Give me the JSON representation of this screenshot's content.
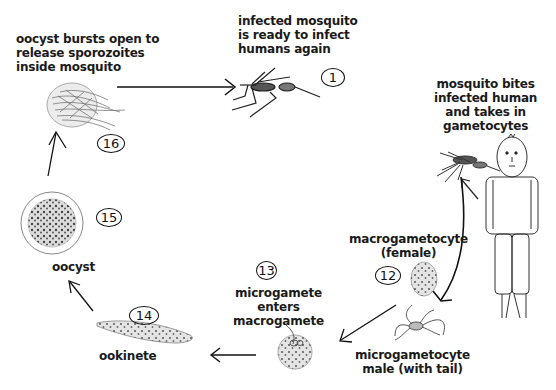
{
  "diagram": {
    "stages": [
      {
        "number": "1",
        "label": "infected mosquito\nis ready to infect\nhumans again"
      },
      {
        "number": "",
        "label": "mosquito bites\ninfected human\nand takes in\ngametocytes"
      },
      {
        "number": "12",
        "label": "macrogametocyte\n(female)"
      },
      {
        "number": "",
        "label": "microgametocyte\nmale (with tail)"
      },
      {
        "number": "13",
        "label": "microgamete\nenters\nmacrogamete"
      },
      {
        "number": "14",
        "label": "ookinete"
      },
      {
        "number": "15",
        "label": "oocyst"
      },
      {
        "number": "16",
        "label": "oocyst bursts open to\nrelease sporozoites\ninside mosquito"
      }
    ]
  },
  "colors": {
    "background": "#ffffff",
    "ink": "#1a1a1a",
    "cell_fill": "#e4e4e4",
    "dots": "#555555"
  }
}
